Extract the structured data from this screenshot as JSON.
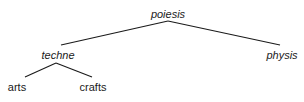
{
  "diagram": {
    "type": "tree",
    "line_color": "#1a1a1a",
    "text_color": "#1a1a1a",
    "nodes": [
      {
        "id": "poiesis",
        "label": "poiesis",
        "italic": true,
        "x": 168,
        "y": 8
      },
      {
        "id": "techne",
        "label": "techne",
        "italic": true,
        "x": 58,
        "y": 49
      },
      {
        "id": "physis",
        "label": "physis",
        "italic": true,
        "x": 282,
        "y": 49
      },
      {
        "id": "arts",
        "label": "arts",
        "italic": false,
        "x": 17,
        "y": 81
      },
      {
        "id": "crafts",
        "label": "crafts",
        "italic": false,
        "x": 93,
        "y": 81
      }
    ],
    "edges": [
      {
        "from": "poiesis",
        "to": "techne"
      },
      {
        "from": "poiesis",
        "to": "physis"
      },
      {
        "from": "techne",
        "to": "arts"
      },
      {
        "from": "techne",
        "to": "crafts"
      }
    ]
  }
}
